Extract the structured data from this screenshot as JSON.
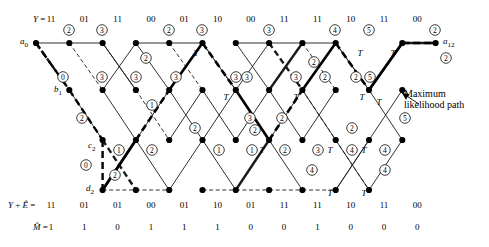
{
  "figure": {
    "type": "viterbi-trellis",
    "title_annotation": {
      "line1": "Maximum",
      "line2": "likelihood path"
    },
    "node_labels": {
      "start": "a",
      "start_sub": "0",
      "b": "b",
      "b_sub": "1",
      "c": "c",
      "c_sub": "2",
      "d": "d",
      "d_sub": "2",
      "end": "a",
      "end_sub": "12"
    }
  },
  "sequences": {
    "received": {
      "label": "Y = ",
      "values": [
        "11",
        "01",
        "11",
        "00",
        "01",
        "10",
        "00",
        "11",
        "11",
        "10",
        "11",
        "00"
      ]
    },
    "corrected": {
      "label": "Y + Ê = ",
      "values": [
        "11",
        "01",
        "01",
        "00",
        "01",
        "10",
        "01",
        "11",
        "11",
        "10",
        "11",
        "00"
      ]
    },
    "message": {
      "label": "M̂ = ",
      "values": [
        "1",
        "1",
        "0",
        "1",
        "1",
        "1",
        "0",
        "0",
        "1",
        "0",
        "0",
        "0"
      ]
    }
  },
  "chart_data": {
    "type": "diagram",
    "columns": 13,
    "rows": [
      "a",
      "b",
      "c",
      "d"
    ],
    "row_y": [
      43,
      90,
      140,
      190
    ],
    "col_x": [
      36,
      69.3,
      102.6,
      135.9,
      169.2,
      202.5,
      235.8,
      269.1,
      302.4,
      335.7,
      369.0,
      402.3,
      435.6
    ],
    "nodes": [
      {
        "id": "a0",
        "r": 0,
        "c": 0
      },
      {
        "id": "a1",
        "r": 0,
        "c": 1
      },
      {
        "id": "a2",
        "r": 0,
        "c": 2
      },
      {
        "id": "a3",
        "r": 0,
        "c": 3
      },
      {
        "id": "a4",
        "r": 0,
        "c": 4
      },
      {
        "id": "a5",
        "r": 0,
        "c": 5
      },
      {
        "id": "a6",
        "r": 0,
        "c": 6
      },
      {
        "id": "a7",
        "r": 0,
        "c": 7
      },
      {
        "id": "a8",
        "r": 0,
        "c": 8
      },
      {
        "id": "a9",
        "r": 0,
        "c": 9
      },
      {
        "id": "a11",
        "r": 0,
        "c": 11
      },
      {
        "id": "a12",
        "r": 0,
        "c": 12
      },
      {
        "id": "b1",
        "r": 1,
        "c": 1
      },
      {
        "id": "b2",
        "r": 1,
        "c": 2
      },
      {
        "id": "b3",
        "r": 1,
        "c": 3
      },
      {
        "id": "b4",
        "r": 1,
        "c": 4
      },
      {
        "id": "b5",
        "r": 1,
        "c": 5
      },
      {
        "id": "b6",
        "r": 1,
        "c": 6
      },
      {
        "id": "b7",
        "r": 1,
        "c": 7
      },
      {
        "id": "b8",
        "r": 1,
        "c": 8
      },
      {
        "id": "b9",
        "r": 1,
        "c": 9
      },
      {
        "id": "b10",
        "r": 1,
        "c": 10
      },
      {
        "id": "b11",
        "r": 1,
        "c": 11
      },
      {
        "id": "c2",
        "r": 2,
        "c": 2
      },
      {
        "id": "c3",
        "r": 2,
        "c": 3
      },
      {
        "id": "c4",
        "r": 2,
        "c": 4
      },
      {
        "id": "c5",
        "r": 2,
        "c": 5
      },
      {
        "id": "c6",
        "r": 2,
        "c": 6
      },
      {
        "id": "c7",
        "r": 2,
        "c": 7
      },
      {
        "id": "c8",
        "r": 2,
        "c": 8
      },
      {
        "id": "c9",
        "r": 2,
        "c": 9
      },
      {
        "id": "c10",
        "r": 2,
        "c": 10
      },
      {
        "id": "c11",
        "r": 2,
        "c": 11
      },
      {
        "id": "d2",
        "r": 3,
        "c": 2
      },
      {
        "id": "d3",
        "r": 3,
        "c": 3
      },
      {
        "id": "d4",
        "r": 3,
        "c": 4
      },
      {
        "id": "d5",
        "r": 3,
        "c": 5
      },
      {
        "id": "d6",
        "r": 3,
        "c": 6
      },
      {
        "id": "d7",
        "r": 3,
        "c": 7
      },
      {
        "id": "d8",
        "r": 3,
        "c": 8
      },
      {
        "id": "d9",
        "r": 3,
        "c": 9
      },
      {
        "id": "d10",
        "r": 3,
        "c": 10
      }
    ],
    "edges": [
      {
        "f": "a0",
        "t": "a1",
        "s": "solid",
        "w": "thin"
      },
      {
        "f": "a1",
        "t": "a2",
        "s": "solid",
        "w": "thin"
      },
      {
        "f": "a3",
        "t": "a4",
        "s": "solid",
        "w": "thin"
      },
      {
        "f": "a4",
        "t": "a5",
        "s": "solid",
        "w": "thin"
      },
      {
        "f": "a6",
        "t": "a7",
        "s": "solid",
        "w": "thin"
      },
      {
        "f": "a7",
        "t": "a8",
        "s": "solid",
        "w": "thin"
      },
      {
        "f": "a8",
        "t": "a9",
        "s": "solid",
        "w": "thin"
      },
      {
        "f": "a11",
        "t": "a12",
        "s": "solid",
        "w": "thick"
      },
      {
        "f": "a0",
        "t": "b1",
        "s": "dash",
        "w": "thick"
      },
      {
        "f": "a1",
        "t": "b2",
        "s": "dash",
        "w": "thin"
      },
      {
        "f": "a2",
        "t": "b3",
        "s": "solid",
        "w": "thin"
      },
      {
        "f": "a4",
        "t": "b5",
        "s": "dash",
        "w": "thin"
      },
      {
        "f": "a5",
        "t": "b6",
        "s": "dash",
        "w": "thin"
      },
      {
        "f": "a7",
        "t": "b8",
        "s": "dash",
        "w": "thick"
      },
      {
        "f": "a8",
        "t": "b9",
        "s": "dash",
        "w": "thin"
      },
      {
        "f": "a9",
        "t": "b10",
        "s": "solid",
        "w": "thin"
      },
      {
        "f": "b1",
        "t": "c2",
        "s": "solid",
        "w": "thin"
      },
      {
        "f": "b2",
        "t": "a3",
        "s": "solid",
        "w": "thin"
      },
      {
        "f": "b3",
        "t": "c4",
        "s": "dash",
        "w": "thin"
      },
      {
        "f": "b4",
        "t": "a5",
        "s": "solid",
        "w": "thin"
      },
      {
        "f": "b5",
        "t": "c6",
        "s": "solid",
        "w": "thin"
      },
      {
        "f": "b6",
        "t": "a7",
        "s": "solid",
        "w": "thin"
      },
      {
        "f": "b7",
        "t": "a8",
        "s": "solid",
        "w": "thick"
      },
      {
        "f": "b7",
        "t": "c8",
        "s": "solid",
        "w": "thin"
      },
      {
        "f": "b8",
        "t": "c9",
        "s": "dash",
        "w": "thin"
      },
      {
        "f": "b9",
        "t": "a10x",
        "s": "none",
        "w": "thin"
      },
      {
        "f": "b10",
        "t": "a11",
        "s": "solid",
        "w": "thick"
      },
      {
        "f": "c2",
        "t": "d3",
        "s": "dash",
        "w": "thick"
      },
      {
        "f": "c3",
        "t": "b4",
        "s": "solid",
        "w": "thin"
      },
      {
        "f": "c4",
        "t": "b5",
        "s": "solid",
        "w": "thin"
      },
      {
        "f": "c5",
        "t": "b6",
        "s": "solid",
        "w": "thin"
      },
      {
        "f": "c6",
        "t": "b7",
        "s": "solid",
        "w": "thin"
      },
      {
        "f": "c7",
        "t": "b8",
        "s": "solid",
        "w": "thin"
      },
      {
        "f": "c8",
        "t": "b9",
        "s": "solid",
        "w": "thin"
      },
      {
        "f": "c9",
        "t": "d10",
        "s": "dash",
        "w": "thin"
      },
      {
        "f": "c10",
        "t": "b11",
        "s": "solid",
        "w": "thin"
      },
      {
        "f": "d2",
        "t": "c3",
        "s": "solid",
        "w": "thick"
      },
      {
        "f": "d2",
        "t": "d3",
        "s": "dash",
        "w": "thin"
      },
      {
        "f": "d3",
        "t": "d4",
        "s": "dash",
        "w": "thin"
      },
      {
        "f": "d4",
        "t": "c5",
        "s": "solid",
        "w": "thin"
      },
      {
        "f": "d5",
        "t": "d6",
        "s": "dash",
        "w": "thin"
      },
      {
        "f": "d6",
        "t": "c7",
        "s": "solid",
        "w": "thick"
      },
      {
        "f": "d6",
        "t": "d7",
        "s": "dash",
        "w": "thin"
      },
      {
        "f": "d7",
        "t": "d8",
        "s": "dash",
        "w": "thin"
      },
      {
        "f": "d8",
        "t": "d9",
        "s": "dash",
        "w": "thin"
      },
      {
        "f": "d9",
        "t": "c10",
        "s": "solid",
        "w": "thin"
      },
      {
        "f": "d10",
        "t": "c11",
        "s": "solid",
        "w": "thin"
      }
    ],
    "metrics": [
      {
        "v": "2",
        "x": 69,
        "y": 30
      },
      {
        "v": "3",
        "x": 102,
        "y": 30
      },
      {
        "v": "2",
        "x": 169,
        "y": 30
      },
      {
        "v": "3",
        "x": 202,
        "y": 30
      },
      {
        "v": "3",
        "x": 269,
        "y": 30
      },
      {
        "v": "4",
        "x": 335,
        "y": 30
      },
      {
        "v": "5",
        "x": 369,
        "y": 30
      },
      {
        "v": "2",
        "x": 435,
        "y": 30
      },
      {
        "v": "2",
        "x": 146,
        "y": 58
      },
      {
        "v": "2",
        "x": 314,
        "y": 62
      },
      {
        "v": "2",
        "x": 446,
        "y": 58
      },
      {
        "v": "0",
        "x": 63,
        "y": 77
      },
      {
        "v": "3",
        "x": 102,
        "y": 77
      },
      {
        "v": "3",
        "x": 136,
        "y": 77
      },
      {
        "v": "3",
        "x": 176,
        "y": 77
      },
      {
        "v": "3",
        "x": 236,
        "y": 77
      },
      {
        "v": "3",
        "x": 247,
        "y": 77
      },
      {
        "v": "3",
        "x": 296,
        "y": 77
      },
      {
        "v": "2",
        "x": 325,
        "y": 77
      },
      {
        "v": "2",
        "x": 356,
        "y": 77
      },
      {
        "v": "5",
        "x": 370,
        "y": 77
      },
      {
        "v": "1",
        "x": 152,
        "y": 105
      },
      {
        "v": "2",
        "x": 82,
        "y": 118
      },
      {
        "v": "2",
        "x": 195,
        "y": 128
      },
      {
        "v": "3",
        "x": 250,
        "y": 118
      },
      {
        "v": "2",
        "x": 282,
        "y": 118
      },
      {
        "v": "5",
        "x": 405,
        "y": 118
      },
      {
        "v": "1",
        "x": 119,
        "y": 150
      },
      {
        "v": "2",
        "x": 152,
        "y": 150
      },
      {
        "v": "1",
        "x": 219,
        "y": 150
      },
      {
        "v": "1",
        "x": 252,
        "y": 150
      },
      {
        "v": "2",
        "x": 285,
        "y": 150
      },
      {
        "v": "3",
        "x": 318,
        "y": 150
      },
      {
        "v": "4",
        "x": 352,
        "y": 150
      },
      {
        "v": "4",
        "x": 385,
        "y": 150
      },
      {
        "v": "2",
        "x": 352,
        "y": 128
      },
      {
        "v": "0",
        "x": 86,
        "y": 165
      },
      {
        "v": "4",
        "x": 385,
        "y": 170
      },
      {
        "v": "4",
        "x": 312,
        "y": 170
      },
      {
        "v": "2",
        "x": 115,
        "y": 175
      },
      {
        "v": "2",
        "x": 255,
        "y": 130
      }
    ],
    "t_marks": [
      {
        "x": 196,
        "y": 56
      },
      {
        "x": 360,
        "y": 56
      },
      {
        "x": 393,
        "y": 56
      },
      {
        "x": 226,
        "y": 100
      },
      {
        "x": 296,
        "y": 100
      },
      {
        "x": 362,
        "y": 100
      },
      {
        "x": 379,
        "y": 105
      },
      {
        "x": 262,
        "y": 153
      },
      {
        "x": 330,
        "y": 153
      },
      {
        "x": 364,
        "y": 153
      },
      {
        "x": 330,
        "y": 196
      },
      {
        "x": 364,
        "y": 196
      }
    ]
  }
}
